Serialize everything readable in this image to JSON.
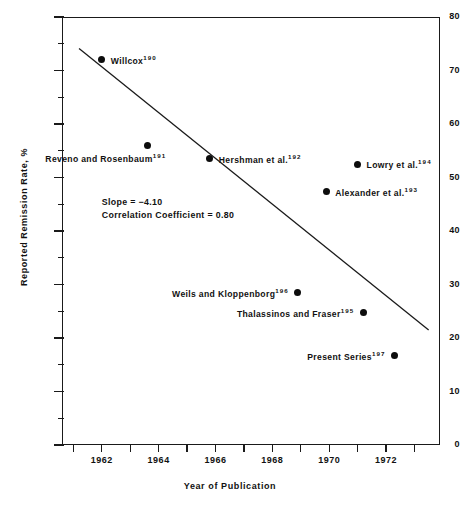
{
  "chart_data": {
    "type": "scatter",
    "title": "",
    "xlabel": "Year of Publication",
    "ylabel": "Reported Remission Rate, %",
    "xlim": [
      1960.6,
      1973.9
    ],
    "ylim": [
      0,
      80
    ],
    "grid": false,
    "legend": "none",
    "xticks": [
      1961,
      1962,
      1963,
      1964,
      1965,
      1966,
      1967,
      1968,
      1969,
      1970,
      1971,
      1972,
      1973
    ],
    "xtick_labels": [
      "",
      "1962",
      "",
      "1964",
      "",
      "1966",
      "",
      "1968",
      "",
      "1970",
      "",
      "1972",
      ""
    ],
    "yticks_major": [
      0,
      10,
      20,
      30,
      40,
      50,
      60,
      70,
      80
    ],
    "yticks_minor": [
      5,
      15,
      25,
      35,
      45,
      55,
      65,
      75
    ],
    "points": [
      {
        "label": "Willcox",
        "ref": "190",
        "x": 1962.0,
        "y": 72.0,
        "label_side": "right"
      },
      {
        "label": "Reveno and Rosenbaum",
        "ref": "191",
        "x": 1963.6,
        "y": 56.0,
        "label_side": "below-left"
      },
      {
        "label": "Hershman et al.",
        "ref": "192",
        "x": 1965.8,
        "y": 53.5,
        "label_side": "right"
      },
      {
        "label": "Lowry et al.",
        "ref": "194",
        "x": 1971.0,
        "y": 52.5,
        "label_side": "right"
      },
      {
        "label": "Alexander et al.",
        "ref": "193",
        "x": 1969.9,
        "y": 47.3,
        "label_side": "right"
      },
      {
        "label": "Weils and Kloppenborg",
        "ref": "196",
        "x": 1968.9,
        "y": 28.5,
        "label_side": "left"
      },
      {
        "label": "Thalassinos and Fraser",
        "ref": "195",
        "x": 1971.2,
        "y": 24.7,
        "label_side": "left"
      },
      {
        "label": "Present Series",
        "ref": "197",
        "x": 1972.3,
        "y": 16.7,
        "label_side": "left"
      }
    ],
    "trendline": {
      "x_start": 1961.2,
      "y_start": 74.1,
      "x_end": 1973.5,
      "y_end": 21.5,
      "slope": -4.1,
      "correlation_coefficient": 0.8
    },
    "annotations": {
      "slope_text": "Slope = −4.10",
      "correlation_text": "Correlation Coefficient = 0.80"
    }
  },
  "colors": {
    "axis": "#1a1a1a",
    "marker": "#0d0d0d",
    "text": "#111111",
    "background": "#ffffff"
  }
}
